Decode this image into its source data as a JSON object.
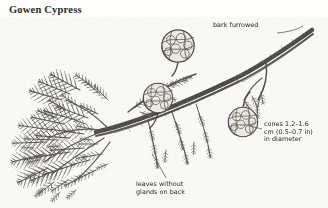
{
  "plate": {
    "title": "Gowen Cypress",
    "subject": "Gowen Cypress branch with cones",
    "medium": "pen-and-ink botanical illustration",
    "background_color": "#fdfdfb",
    "ink_color": "#3b3733"
  },
  "annotations": [
    {
      "id": "bark",
      "text": "bark furrowed",
      "target": "main branch upper right",
      "leader": true
    },
    {
      "id": "cones",
      "text": "cones 1.2–1.6\ncm (0.5–0.7 in)\nin diameter",
      "target": "globular seed cone",
      "leader": true
    },
    {
      "id": "leaves",
      "text": "leaves without\nglands on back",
      "target": "scale-leaf foliage spray",
      "leader": true
    }
  ],
  "figure_elements": {
    "cones": [
      {
        "id": "cone-upper",
        "cx": 178,
        "cy": 46,
        "r": 17
      },
      {
        "id": "cone-middle",
        "cx": 158,
        "cy": 98,
        "r": 15
      },
      {
        "id": "cone-lower-right",
        "cx": 243,
        "cy": 122,
        "r": 15
      }
    ],
    "branch": {
      "description": "main woody branch running from lower left to upper right with furrowed bark"
    },
    "foliage": {
      "description": "dense feathery sprays of scale-like leaves filling the lower left"
    }
  }
}
